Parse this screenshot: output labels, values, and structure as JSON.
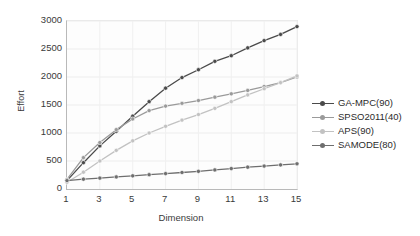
{
  "chart_data": {
    "type": "line",
    "title": "",
    "xlabel": "Dimension",
    "ylabel": "Effort",
    "xlim": [
      1,
      15
    ],
    "ylim": [
      0,
      3000
    ],
    "xticks": [
      1,
      3,
      5,
      7,
      9,
      11,
      13,
      15
    ],
    "yticks": [
      0,
      500,
      1000,
      1500,
      2000,
      2500,
      3000
    ],
    "grid": true,
    "legend_position": "right",
    "x": [
      1,
      2,
      3,
      4,
      5,
      6,
      7,
      8,
      9,
      10,
      11,
      12,
      13,
      14,
      15
    ],
    "series": [
      {
        "name": "GA-MPC(90)",
        "color": "#4a4a4a",
        "values": [
          150,
          470,
          770,
          1030,
          1300,
          1560,
          1800,
          1990,
          2130,
          2280,
          2380,
          2520,
          2650,
          2760,
          2900
        ]
      },
      {
        "name": "SPSO2011(40)",
        "color": "#9a9a9a",
        "values": [
          170,
          560,
          830,
          1060,
          1250,
          1400,
          1480,
          1530,
          1580,
          1640,
          1700,
          1760,
          1830,
          1900,
          2000
        ]
      },
      {
        "name": "APS(90)",
        "color": "#c2c2c2",
        "values": [
          120,
          300,
          500,
          690,
          860,
          1000,
          1120,
          1230,
          1330,
          1440,
          1560,
          1680,
          1790,
          1900,
          2020
        ]
      },
      {
        "name": "SAMODE(80)",
        "color": "#6e6e6e",
        "values": [
          150,
          175,
          195,
          215,
          235,
          255,
          275,
          295,
          315,
          340,
          365,
          390,
          410,
          430,
          450
        ]
      }
    ],
    "legend": [
      "GA-MPC(90)",
      "SPSO2011(40)",
      "APS(90)",
      "SAMODE(80)"
    ]
  }
}
